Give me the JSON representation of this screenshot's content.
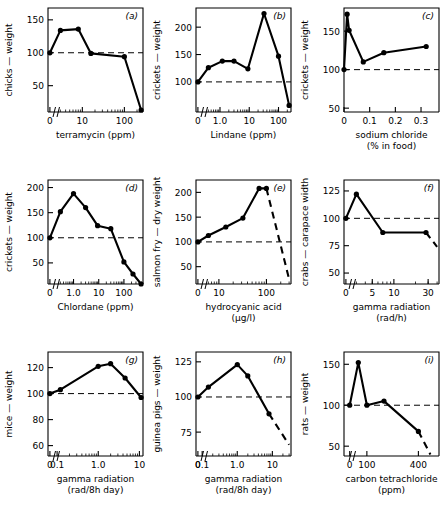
{
  "figure": {
    "panel_count": 9,
    "reference_line_value": 100,
    "reference_line_style": "dashed",
    "line_color": "#000000",
    "marker_color": "#000000",
    "background": "#ffffff"
  },
  "chart_data": [
    {
      "type": "line",
      "panel": "(a)",
      "title": "",
      "xlabel": "terramycin (ppm)",
      "ylabel": "chicks — weight",
      "xscale": "log-with-zero-break",
      "xticks": [
        "0",
        "10",
        "100"
      ],
      "yticks": [
        "50",
        "100",
        "150"
      ],
      "ylim": [
        10,
        168
      ],
      "x": [
        0,
        3,
        8,
        16,
        100,
        250
      ],
      "values": [
        100,
        134,
        136,
        99,
        94,
        13
      ],
      "dashed_from_index": null,
      "reference_line": 100
    },
    {
      "type": "line",
      "panel": "(b)",
      "title": "",
      "xlabel": "Lindane (ppm)",
      "ylabel": "crickets — weight",
      "xscale": "log-with-zero-break",
      "xticks": [
        "0",
        "1.0",
        "10",
        "100"
      ],
      "yticks": [
        "100",
        "150",
        "200"
      ],
      "ylim": [
        45,
        235
      ],
      "x": [
        0,
        0.4,
        1.2,
        3,
        9,
        32,
        100,
        230
      ],
      "values": [
        100,
        126,
        138,
        138,
        124,
        225,
        147,
        57
      ],
      "dashed_from_index": null,
      "reference_line": 100
    },
    {
      "type": "line",
      "panel": "(c)",
      "title": "",
      "xlabel": "sodium chloride",
      "xlabel2": "(% in food)",
      "ylabel": "crickets — weight",
      "xscale": "linear",
      "xticks": [
        "0",
        "0.1",
        "0.2",
        "0.3"
      ],
      "yticks": [
        "50",
        "100",
        "150"
      ],
      "ylim": [
        45,
        180
      ],
      "x": [
        0,
        0.012,
        0.02,
        0.075,
        0.155,
        0.32
      ],
      "values": [
        100,
        172,
        151,
        110,
        122,
        130
      ],
      "dashed_from_index": null,
      "reference_line": 100
    },
    {
      "type": "line",
      "panel": "(d)",
      "title": "",
      "xlabel": "Chlordane (ppm)",
      "ylabel": "crickets — weight",
      "xscale": "log-with-zero-break",
      "xticks": [
        "0",
        "1.0",
        "10",
        "100"
      ],
      "yticks": [
        "50",
        "100",
        "150",
        "200"
      ],
      "ylim": [
        8,
        215
      ],
      "x": [
        0,
        0.3,
        1.0,
        3,
        9,
        30,
        100,
        230,
        480
      ],
      "values": [
        100,
        152,
        188,
        160,
        124,
        118,
        52,
        28,
        8
      ],
      "dashed_from_index": null,
      "reference_line": 100
    },
    {
      "type": "line",
      "panel": "(e)",
      "title": "",
      "xlabel": "hydrocyanic acid",
      "xlabel2": "(µg/l)",
      "ylabel": "salmon fry — dry weight",
      "xscale": "log-with-zero-break",
      "xticks": [
        "0",
        "10",
        "100"
      ],
      "yticks": [
        "50",
        "100",
        "150",
        "200"
      ],
      "ylim": [
        15,
        225
      ],
      "x": [
        0,
        6,
        14,
        32,
        70,
        100,
        300
      ],
      "values": [
        100,
        113,
        130,
        148,
        208,
        208,
        25
      ],
      "dashed_from_index": 5,
      "reference_line": 100
    },
    {
      "type": "line",
      "panel": "(f)",
      "title": "",
      "xlabel": "gamma radiation",
      "xlabel2": "(rad/h)",
      "ylabel": "crabs — carapace width",
      "xscale": "log-with-zero-break",
      "xticks": [
        "0",
        "5",
        "10",
        "30"
      ],
      "yticks": [
        "50",
        "75",
        "100",
        "125"
      ],
      "ylim": [
        40,
        135
      ],
      "x": [
        0,
        3,
        7,
        28,
        40
      ],
      "values": [
        100,
        122,
        87,
        87,
        74
      ],
      "dashed_from_index": 3,
      "reference_line": 100
    },
    {
      "type": "line",
      "panel": "(g)",
      "title": "",
      "xlabel": "gamma radiation",
      "xlabel2": "(rad/8h day)",
      "ylabel": "mice — weight",
      "xscale": "log-with-zero-break",
      "xticks": [
        "0",
        "0.1",
        "1.0",
        "10"
      ],
      "yticks": [
        "60",
        "80",
        "100",
        "120"
      ],
      "ylim": [
        52,
        132
      ],
      "x": [
        0,
        0.12,
        1.0,
        2.0,
        4.5,
        11
      ],
      "values": [
        100,
        103,
        121,
        123,
        112,
        97
      ],
      "dashed_from_index": null,
      "reference_line": 100
    },
    {
      "type": "line",
      "panel": "(h)",
      "title": "",
      "xlabel": "gamma radiation",
      "xlabel2": "(rad/8h day)",
      "ylabel": "guinea pigs — weight",
      "xscale": "log-with-zero-break",
      "xticks": [
        "0",
        "0.1",
        "1.0",
        "10"
      ],
      "yticks": [
        "75",
        "100",
        "125"
      ],
      "ylim": [
        58,
        132
      ],
      "x": [
        0,
        0.15,
        1.0,
        2.0,
        8,
        30
      ],
      "values": [
        100,
        107,
        123,
        115,
        88,
        66
      ],
      "dashed_from_index": 4,
      "reference_line": 100
    },
    {
      "type": "line",
      "panel": "(i)",
      "title": "",
      "xlabel": "carbon tetrachloride",
      "xlabel2": "(ppm)",
      "ylabel": "rats — weight",
      "xscale": "linear-with-break",
      "xticks": [
        "0",
        "100",
        "400"
      ],
      "yticks": [
        "50",
        "100",
        "150"
      ],
      "ylim": [
        38,
        165
      ],
      "x": [
        0,
        50,
        100,
        200,
        400,
        470
      ],
      "values": [
        100,
        152,
        100,
        105,
        68,
        40
      ],
      "dashed_from_index": 4,
      "reference_line": 100
    }
  ]
}
